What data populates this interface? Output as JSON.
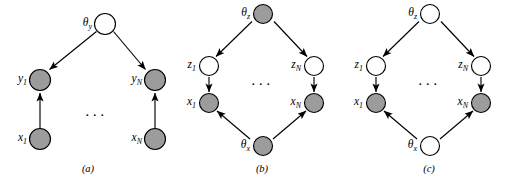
{
  "figure": {
    "type": "graphical-model-diagram",
    "panel_count": 3,
    "colors": {
      "shaded_node_fill": "#9c9c9c",
      "open_node_fill": "#ffffff",
      "stroke": "#000000",
      "background": "#ffffff"
    },
    "ellipsis_glyph": "···",
    "panels": [
      {
        "id": "a",
        "caption": "(a)",
        "ellipsis": "···",
        "nodes": [
          {
            "id": "theta_y",
            "label_main": "θ",
            "label_sub": "y",
            "shaded": false
          },
          {
            "id": "y_1",
            "label_main": "y",
            "label_sub": "1",
            "shaded": true
          },
          {
            "id": "y_N",
            "label_main": "y",
            "label_sub": "N",
            "shaded": true
          },
          {
            "id": "x_1",
            "label_main": "x",
            "label_sub": "1",
            "shaded": true
          },
          {
            "id": "x_N",
            "label_main": "x",
            "label_sub": "N",
            "shaded": true
          }
        ],
        "edges": [
          {
            "from": "theta_y",
            "to": "y_1"
          },
          {
            "from": "theta_y",
            "to": "y_N"
          },
          {
            "from": "x_1",
            "to": "y_1"
          },
          {
            "from": "x_N",
            "to": "y_N"
          }
        ]
      },
      {
        "id": "b",
        "caption": "(b)",
        "ellipsis": "···",
        "nodes": [
          {
            "id": "theta_z",
            "label_main": "θ",
            "label_sub": "z",
            "shaded": true
          },
          {
            "id": "z_1",
            "label_main": "z",
            "label_sub": "1",
            "shaded": false
          },
          {
            "id": "z_N",
            "label_main": "z",
            "label_sub": "N",
            "shaded": false
          },
          {
            "id": "x_1",
            "label_main": "x",
            "label_sub": "1",
            "shaded": true
          },
          {
            "id": "x_N",
            "label_main": "x",
            "label_sub": "N",
            "shaded": true
          },
          {
            "id": "theta_x",
            "label_main": "θ",
            "label_sub": "x",
            "shaded": true
          }
        ],
        "edges": [
          {
            "from": "theta_z",
            "to": "z_1"
          },
          {
            "from": "theta_z",
            "to": "z_N"
          },
          {
            "from": "z_1",
            "to": "x_1"
          },
          {
            "from": "z_N",
            "to": "x_N"
          },
          {
            "from": "theta_x",
            "to": "x_1"
          },
          {
            "from": "theta_x",
            "to": "x_N"
          }
        ]
      },
      {
        "id": "c",
        "caption": "(c)",
        "ellipsis": "···",
        "nodes": [
          {
            "id": "theta_z",
            "label_main": "θ",
            "label_sub": "z",
            "shaded": false
          },
          {
            "id": "z_1",
            "label_main": "z",
            "label_sub": "1",
            "shaded": false
          },
          {
            "id": "z_N",
            "label_main": "z",
            "label_sub": "N",
            "shaded": false
          },
          {
            "id": "x_1",
            "label_main": "x",
            "label_sub": "1",
            "shaded": true
          },
          {
            "id": "x_N",
            "label_main": "x",
            "label_sub": "N",
            "shaded": true
          },
          {
            "id": "theta_x",
            "label_main": "θ",
            "label_sub": "x",
            "shaded": false
          }
        ],
        "edges": [
          {
            "from": "theta_z",
            "to": "z_1"
          },
          {
            "from": "theta_z",
            "to": "z_N"
          },
          {
            "from": "z_1",
            "to": "x_1"
          },
          {
            "from": "z_N",
            "to": "x_N"
          },
          {
            "from": "theta_x",
            "to": "x_1"
          },
          {
            "from": "theta_x",
            "to": "x_N"
          }
        ]
      }
    ]
  }
}
